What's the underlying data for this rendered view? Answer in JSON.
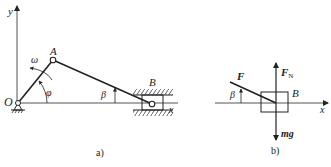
{
  "figure_a": {
    "caption": "a)",
    "axis_y_label": "y",
    "axis_x_label": "x",
    "origin_label": "O",
    "point_A_label": "A",
    "point_B_label": "B",
    "omega_label": "ω",
    "phi_label": "φ",
    "beta_label": "β"
  },
  "figure_b": {
    "caption": "b)",
    "axis_x_label": "x",
    "force_F_label": "F",
    "normal_force_label": "F",
    "normal_force_subscript": "N",
    "weight_label": "mg",
    "block_label": "B",
    "beta_label": "β"
  },
  "colors": {
    "line": "#222222",
    "axis": "#555555",
    "background": "#ffffff"
  }
}
